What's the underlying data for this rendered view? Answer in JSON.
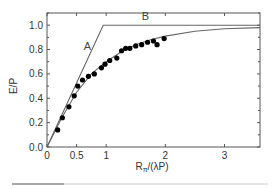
{
  "chart_data": {
    "type": "scatter",
    "title": "",
    "xlabel": "R_π/(λP)",
    "xlabel_main": "R",
    "xlabel_sub": "π",
    "xlabel_rest": "/(λP)",
    "ylabel": "E/P",
    "xlim": [
      0,
      3.6
    ],
    "ylim": [
      0,
      1.1
    ],
    "grid": false,
    "xticks": [
      0,
      0.5,
      1,
      2,
      3
    ],
    "xtick_labels": [
      "0",
      "0.5",
      "1",
      "2",
      "3"
    ],
    "yticks": [
      0.0,
      0.2,
      0.4,
      0.6,
      0.8,
      1.0
    ],
    "ytick_labels": [
      "0.0",
      "0.2",
      "0.4",
      "0.6",
      "0.8",
      "1.0"
    ],
    "annotations": [
      {
        "text": "A",
        "x": 0.62,
        "y": 0.8
      },
      {
        "text": "B",
        "x": 1.6,
        "y": 1.04
      }
    ],
    "series": [
      {
        "name": "A/B limit line",
        "kind": "line",
        "points": [
          [
            0,
            0
          ],
          [
            0.95,
            1.0
          ],
          [
            3.6,
            1.0
          ]
        ]
      },
      {
        "name": "fit curve",
        "kind": "line",
        "points": [
          [
            0,
            0
          ],
          [
            0.25,
            0.24
          ],
          [
            0.5,
            0.45
          ],
          [
            0.75,
            0.6
          ],
          [
            1.0,
            0.7
          ],
          [
            1.25,
            0.78
          ],
          [
            1.5,
            0.84
          ],
          [
            1.75,
            0.88
          ],
          [
            2.0,
            0.91
          ],
          [
            2.5,
            0.95
          ],
          [
            3.0,
            0.97
          ],
          [
            3.6,
            0.98
          ]
        ]
      },
      {
        "name": "measured",
        "kind": "scatter",
        "points": [
          [
            0.18,
            0.14
          ],
          [
            0.26,
            0.24
          ],
          [
            0.37,
            0.33
          ],
          [
            0.46,
            0.42
          ],
          [
            0.52,
            0.5
          ],
          [
            0.6,
            0.55
          ],
          [
            0.7,
            0.58
          ],
          [
            0.8,
            0.6
          ],
          [
            0.92,
            0.65
          ],
          [
            0.98,
            0.68
          ],
          [
            1.06,
            0.71
          ],
          [
            1.18,
            0.73
          ],
          [
            1.26,
            0.79
          ],
          [
            1.33,
            0.81
          ],
          [
            1.4,
            0.81
          ],
          [
            1.5,
            0.83
          ],
          [
            1.6,
            0.84
          ],
          [
            1.7,
            0.86
          ],
          [
            1.8,
            0.87
          ],
          [
            1.86,
            0.84
          ],
          [
            1.98,
            0.89
          ]
        ]
      }
    ]
  }
}
